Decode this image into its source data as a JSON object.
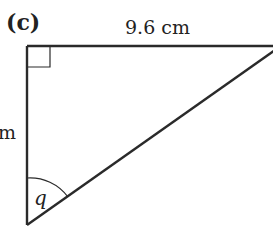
{
  "figure": {
    "part_label": "(c)",
    "top_side_label": "9.6 cm",
    "left_side_label_partial": "m",
    "angle_label": "q",
    "right_angle_marker": true,
    "colors": {
      "line": "#2a2a2a",
      "text": "#222222",
      "background": "#ffffff"
    }
  }
}
